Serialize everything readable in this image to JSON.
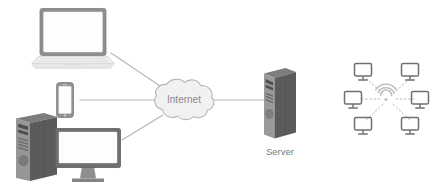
{
  "diagram": {
    "type": "network-topology",
    "background_color": "#ffffff",
    "width": 440,
    "height": 192,
    "palette": {
      "line": "#b0b0b0",
      "dashed_line": "#bdbdbd",
      "cloud_fill": "#f2f2f2",
      "cloud_stroke": "#b3b3b3",
      "cloud_text": "#8a8a8a",
      "label_text": "#7b7b7b",
      "device_dark": "#6e6e6e",
      "device_mid": "#8c8c8c",
      "device_light": "#d9d9d9",
      "device_screen": "#fdfdfd",
      "tower_side": "#595959",
      "tower_face": "#9a9a9a",
      "tower_top": "#7d7d7d",
      "wifi": "#bdbdbd",
      "small_monitor": "#6f6f6f"
    },
    "nodes": [
      {
        "id": "laptop",
        "icon": "laptop-icon",
        "label": "",
        "x": 73,
        "y": 38
      },
      {
        "id": "smartphone",
        "icon": "smartphone-icon",
        "label": "",
        "x": 65,
        "y": 100
      },
      {
        "id": "desktop",
        "icon": "desktop-computer-icon",
        "label": "",
        "x": 67,
        "y": 148
      },
      {
        "id": "internet",
        "icon": "cloud-icon",
        "label": "Internet",
        "x": 184,
        "y": 100
      },
      {
        "id": "server",
        "icon": "server-tower-icon",
        "label": "Server",
        "x": 278,
        "y": 104
      },
      {
        "id": "wireless-network",
        "icon": "wifi-network-icon",
        "label": "",
        "x": 388,
        "y": 97
      }
    ],
    "links": [
      {
        "from": "laptop",
        "to": "internet",
        "style": "solid"
      },
      {
        "from": "smartphone",
        "to": "internet",
        "style": "solid"
      },
      {
        "from": "desktop",
        "to": "internet",
        "style": "solid"
      },
      {
        "from": "internet",
        "to": "server",
        "style": "solid"
      }
    ],
    "wireless_cluster": {
      "center_icon": "wifi-icon",
      "client_count": 6,
      "client_icon": "monitor-icon",
      "link_style": "dashed"
    },
    "labels": {
      "internet": "Internet",
      "server": "Server"
    }
  }
}
